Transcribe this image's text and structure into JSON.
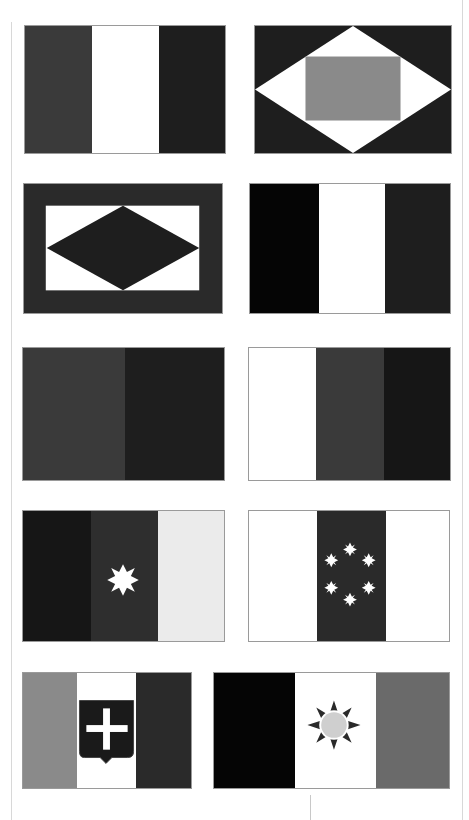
{
  "colors": {
    "dark_gray": "#3a3a3a",
    "very_dark": "#1e1e1e",
    "black": "#050505",
    "white": "#ffffff",
    "mid_gray": "#808080",
    "light_gray": "#e6e6e6",
    "sun_disc": "#cfcfcf"
  },
  "flags": [
    {
      "id": 1,
      "type": "vertical-tricolor",
      "stripes": [
        "#3a3a3a",
        "#ffffff",
        "#1e1e1e"
      ]
    },
    {
      "id": 2,
      "type": "diamond-with-rectangle",
      "field": "#1e1e1e",
      "diamond": "#ffffff",
      "rectangle": "#8a8a8a"
    },
    {
      "id": 3,
      "type": "border-rectangle-diamond",
      "border": "#2a2a2a",
      "inner": "#ffffff",
      "diamond": "#1e1e1e"
    },
    {
      "id": 4,
      "type": "vertical-tricolor",
      "stripes": [
        "#050505",
        "#ffffff",
        "#1e1e1e"
      ]
    },
    {
      "id": 5,
      "type": "vertical-bicolor",
      "stripes": [
        "#3a3a3a",
        "#1e1e1e"
      ]
    },
    {
      "id": 6,
      "type": "vertical-tricolor",
      "stripes": [
        "#ffffff",
        "#3a3a3a",
        "#161616"
      ]
    },
    {
      "id": 7,
      "type": "vertical-tricolor-star",
      "stripes": [
        "#161616",
        "#2e2e2e",
        "#ebebeb"
      ],
      "emblem": "eight-point-star"
    },
    {
      "id": 8,
      "type": "vertical-tricolor-stars",
      "stripes": [
        "#ffffff",
        "#2a2a2a",
        "#ffffff"
      ],
      "emblem": "six-eight-point-stars-ring"
    },
    {
      "id": 9,
      "type": "vertical-tricolor-shield",
      "stripes": [
        "#8a8a8a",
        "#ffffff",
        "#2a2a2a"
      ],
      "emblem": "shield-with-cross"
    },
    {
      "id": 10,
      "type": "vertical-tricolor-sun",
      "stripes": [
        "#050505",
        "#ffffff",
        "#6a6a6a"
      ],
      "emblem": "sun-with-rays"
    }
  ]
}
